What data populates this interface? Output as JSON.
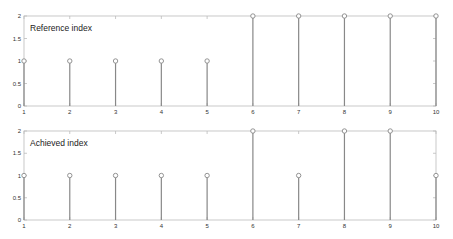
{
  "chart_data": [
    {
      "type": "stem",
      "title": "Reference index",
      "xlabel": "",
      "ylabel": "",
      "x": [
        1,
        2,
        3,
        4,
        5,
        6,
        7,
        8,
        9,
        10
      ],
      "values": [
        1,
        1,
        1,
        1,
        1,
        2,
        2,
        2,
        2,
        2
      ],
      "xlim": [
        1,
        10
      ],
      "ylim": [
        0,
        2
      ],
      "xticks": [
        "1",
        "2",
        "3",
        "4",
        "5",
        "6",
        "7",
        "8",
        "9",
        "10"
      ],
      "yticks": [
        "0",
        "0.5",
        "1",
        "1.5",
        "2"
      ],
      "grid": false,
      "legend": null
    },
    {
      "type": "stem",
      "title": "Achieved index",
      "xlabel": "",
      "ylabel": "",
      "x": [
        1,
        2,
        3,
        4,
        5,
        6,
        7,
        8,
        9,
        10
      ],
      "values": [
        1,
        1,
        1,
        1,
        1,
        2,
        1,
        2,
        2,
        1
      ],
      "xlim": [
        1,
        10
      ],
      "ylim": [
        0,
        2
      ],
      "xticks": [
        "1",
        "2",
        "3",
        "4",
        "5",
        "6",
        "7",
        "8",
        "9",
        "10"
      ],
      "yticks": [
        "0",
        "0.5",
        "1",
        "1.5",
        "2"
      ],
      "grid": false,
      "legend": null
    }
  ],
  "style": {
    "axis_color": "#bbbbbb",
    "stem_color": "#888888",
    "marker_color": "#888888"
  }
}
